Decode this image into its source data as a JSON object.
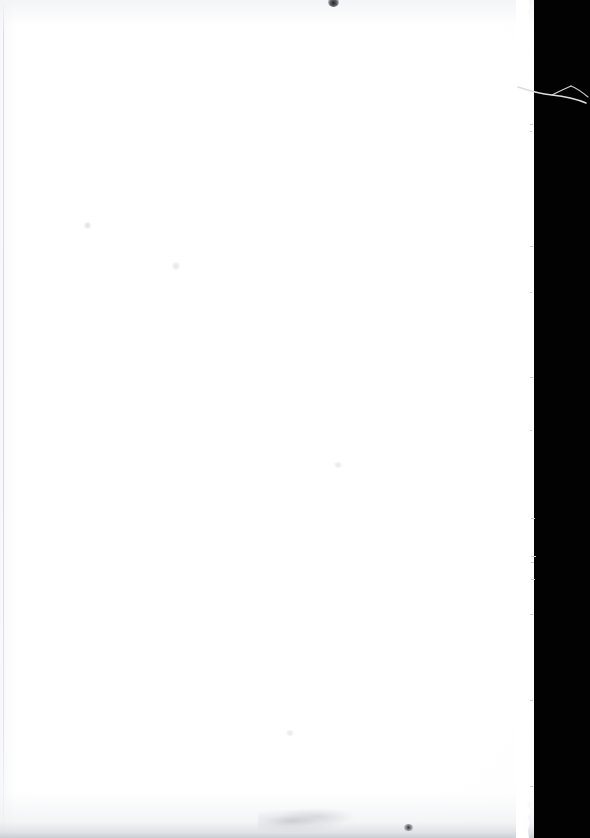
{
  "document": {
    "kind": "scanned-book-page",
    "page_content": "",
    "page_text_visible": "none",
    "page_label": "blank page",
    "orientation": "portrait"
  },
  "canvas": {
    "width_px": 590,
    "height_px": 838
  },
  "paper": {
    "name": "paper-sheet",
    "left_px": 0,
    "top_px": 0,
    "width_px": 534,
    "height_px": 838,
    "color": "#ffffff",
    "tone_color": "#f8f9fb"
  },
  "backdrop": {
    "name": "scanner-backdrop",
    "color": "#020202",
    "left_px": 534,
    "width_px": 56
  },
  "edge": {
    "name": "deckle-edge",
    "description": "ragged torn right edge of sheet",
    "start_x_px": 516,
    "width_px": 26,
    "color": "#ffffff"
  },
  "fiber": {
    "name": "paper-fiber",
    "description": "thin forked fiber over dark field",
    "left_px": 516,
    "top_px": 72,
    "color": "#d8d8d8"
  },
  "artifacts": {
    "speck_top": {
      "label": "dark speck",
      "x_px": 332,
      "y_px": 1
    },
    "smudge_bottom": {
      "label": "faint pencil smudge",
      "x_px": 282,
      "y_px": 818
    },
    "speck_bottom": {
      "label": "dark speck",
      "x_px": 408,
      "y_px": 827
    },
    "binding_line": {
      "label": "faint vertical rule",
      "x_px": 3
    },
    "bottom_band": {
      "label": "grey shadow band",
      "y_px": 822
    }
  }
}
